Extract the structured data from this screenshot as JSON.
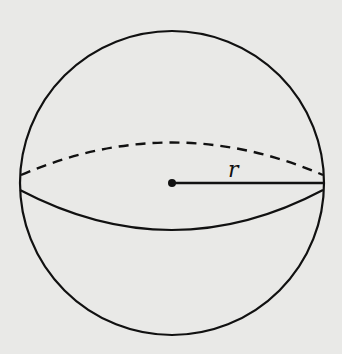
{
  "diagram": {
    "radius_label": "r",
    "colors": {
      "background": "#e9e9e7",
      "stroke": "#111111"
    },
    "shapes": [
      {
        "type": "circle",
        "name": "sphere-outline",
        "cx": 172,
        "cy": 183,
        "r": 152
      },
      {
        "type": "arc",
        "name": "equator-back",
        "style": "dashed"
      },
      {
        "type": "arc",
        "name": "equator-front",
        "style": "solid"
      },
      {
        "type": "point",
        "name": "center",
        "x": 172,
        "y": 183
      },
      {
        "type": "segment",
        "name": "radius",
        "from": [
          172,
          183
        ],
        "to": [
          323,
          183
        ]
      }
    ]
  }
}
